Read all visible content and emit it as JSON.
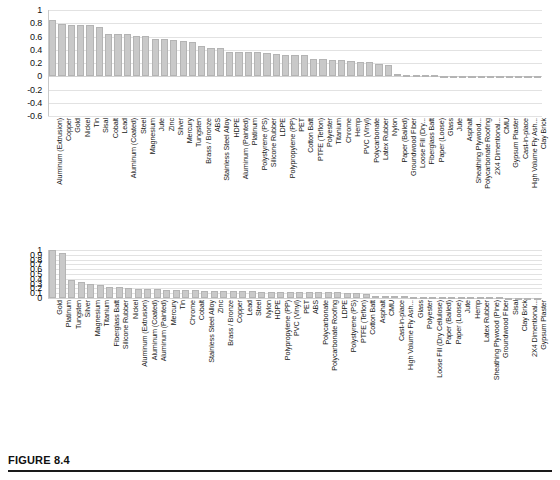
{
  "figure": {
    "caption_label": "FIGURE 8.4"
  },
  "chart_data": [
    {
      "id": "top-chart",
      "type": "bar",
      "title": "",
      "xlabel": "",
      "ylabel": "",
      "ylim": [
        -0.6,
        1
      ],
      "ytick_labels": [
        "1",
        "0.8",
        "0.6",
        "0.4",
        "0.2",
        "0",
        "-0.2",
        "-0.4",
        "-0.6"
      ],
      "yticks": [
        1,
        0.8,
        0.6,
        0.4,
        0.2,
        0,
        -0.2,
        -0.4,
        -0.6
      ],
      "grid": true,
      "legend": "none",
      "bar_color": "#c9c9c9",
      "categories": [
        "Aluminum (Extrusion)",
        "Copper",
        "Gold",
        "Nickel",
        "Tin",
        "Sisal",
        "Cobalt",
        "Lead",
        "Aluminum (Coated)",
        "Steel",
        "Magnesium",
        "Jute",
        "Zinc",
        "Silver",
        "Mercury",
        "Tungsten",
        "Brass / Bronze",
        "ABS",
        "Stainless Steel Alloy",
        "HDPE",
        "Aluminum (Painted)",
        "Platinum",
        "Polystyrene (PS)",
        "Silicone Rubber",
        "LDPE",
        "Polypropylene (PP)",
        "PET",
        "Cotton Batt",
        "PTFE (Teflon)",
        "Polyester",
        "Titanium",
        "Chrome",
        "Hemp",
        "PVC (Vinyl)",
        "Polycarbonate",
        "Latex Rubber",
        "Nylon",
        "Paper (Bailed)",
        "Groundwood Fiber",
        "Loose Fill (Dry...",
        "Fiberglass Batt",
        "Paper (Loose)",
        "Glass",
        "Jute",
        "Asphalt",
        "Sheathing Plywood...",
        "Polycarbonate Roofing",
        "2X4 Dimentional...",
        "CMU",
        "Gypsum Plaster",
        "Cast-in-place",
        "High Volume Fly Ash...",
        "Clay Brick"
      ],
      "values": [
        0.85,
        0.79,
        0.78,
        0.78,
        0.775,
        0.75,
        0.645,
        0.64,
        0.64,
        0.61,
        0.605,
        0.565,
        0.56,
        0.55,
        0.53,
        0.51,
        0.45,
        0.425,
        0.425,
        0.37,
        0.37,
        0.365,
        0.36,
        0.345,
        0.34,
        0.325,
        0.315,
        0.315,
        0.26,
        0.255,
        0.25,
        0.24,
        0.235,
        0.215,
        0.21,
        0.185,
        0.165,
        0.03,
        0.025,
        0.02,
        0.015,
        0.012,
        0.01,
        0.008,
        0.005,
        0.004,
        0.003,
        0.002,
        0.0,
        -0.005,
        -0.008,
        -0.012,
        -0.02
      ]
    },
    {
      "id": "bottom-chart",
      "type": "bar",
      "title": "",
      "xlabel": "",
      "ylabel": "",
      "ylim": [
        0,
        1
      ],
      "ytick_labels": [
        "1",
        "0.9",
        "0.8",
        "0.7",
        "0.6",
        "0.5",
        "0.4",
        "0.3",
        "0.2",
        "0.1",
        "0"
      ],
      "yticks": [
        1,
        0.9,
        0.8,
        0.7,
        0.6,
        0.5,
        0.4,
        0.3,
        0.2,
        0.1,
        0
      ],
      "grid": true,
      "legend": "none",
      "bar_color": "#c9c9c9",
      "categories": [
        "Gold",
        "Platinum",
        "Tungsten",
        "Silver",
        "Magnesium",
        "Titanium",
        "Fiberglass Batt",
        "Silicone Rubber",
        "Nickel",
        "Aluminum (Extrusion)",
        "Aluminum (Coated)",
        "Aluminum (Painted)",
        "Mercury",
        "Tin",
        "Chrome",
        "Cobalt",
        "Stainless Steel Alloy",
        "Zinc",
        "Brass / Bronze",
        "Copper",
        "Lead",
        "Steel",
        "Nylon",
        "HDPE",
        "Polypropylene (PP)",
        "PVC (Vinyl)",
        "PET",
        "ABS",
        "Polycarbonate",
        "Polycarbonate Roofing",
        "LDPE",
        "Polystyrene (PS)",
        "PTFE (Teflon)",
        "Cotton Batt",
        "Asphalt",
        "CMU",
        "Cast-in-place",
        "High Volume Fly Ash...",
        "Glass",
        "Polyester",
        "Loose Fill (Dry Cellulose)",
        "Paper (Bailed)",
        "Paper (Loose)",
        "Jute",
        "Hemp",
        "Latex Rubber",
        "Sheathing Plywood (Pine)",
        "Groundwood Fiber",
        "Sisal",
        "Clay Brick",
        "2X4 Dimentional...",
        "Gypsum Plaster"
      ],
      "values": [
        1.0,
        0.94,
        0.385,
        0.335,
        0.295,
        0.265,
        0.23,
        0.225,
        0.205,
        0.19,
        0.19,
        0.185,
        0.175,
        0.175,
        0.175,
        0.175,
        0.155,
        0.155,
        0.15,
        0.15,
        0.145,
        0.14,
        0.12,
        0.115,
        0.115,
        0.115,
        0.115,
        0.115,
        0.115,
        0.115,
        0.115,
        0.11,
        0.11,
        0.08,
        0.045,
        0.04,
        0.04,
        0.04,
        0.03,
        0.028,
        0.025,
        0.022,
        0.02,
        0.018,
        0.016,
        0.014,
        0.012,
        0.011,
        0.009,
        0.007,
        0.005,
        0.003
      ]
    }
  ]
}
